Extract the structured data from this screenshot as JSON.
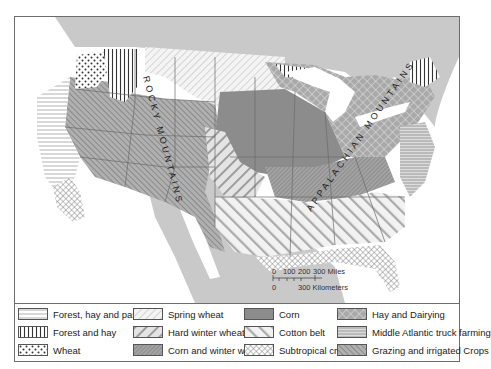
{
  "map": {
    "labels": {
      "rocky": "ROCKY MOUNTAINS",
      "appalachian": "APPALACHIAN MOUNTAINS"
    },
    "scale": {
      "miles_ticks": [
        "0",
        "100",
        "200",
        "300 Miles"
      ],
      "km_ticks": [
        "0",
        "300 Kilometers"
      ]
    },
    "colors": {
      "canada_mexico": "#c9c9c9",
      "water": "#ffffff",
      "border": "#666666",
      "corn": "#8c8c8c",
      "hatch_dark": "#7a7a7a",
      "hatch_light": "#a8a8a8"
    }
  },
  "legend": {
    "items": [
      {
        "label": "Forest, hay and pasture",
        "pattern": "horizontal-lines"
      },
      {
        "label": "Forest and hay",
        "pattern": "vertical-lines"
      },
      {
        "label": "Wheat",
        "pattern": "dots"
      },
      {
        "label": "Spring wheat",
        "pattern": "light-diagonal"
      },
      {
        "label": "Hard winter wheat",
        "pattern": "wide-diagonal"
      },
      {
        "label": "Corn and winter wheat",
        "pattern": "dense-diagonal"
      },
      {
        "label": "Corn",
        "pattern": "solid-gray"
      },
      {
        "label": "Cotton belt",
        "pattern": "wide-light-diagonal"
      },
      {
        "label": "Subtropical crops",
        "pattern": "crosshatch"
      },
      {
        "label": "Hay and Dairying",
        "pattern": "diagonal-crosshatch"
      },
      {
        "label": "Middle Atlantic truck farming",
        "pattern": "horizontal-lines-gray"
      },
      {
        "label": "Grazing and irrigated Crops",
        "pattern": "back-diagonal"
      }
    ]
  }
}
